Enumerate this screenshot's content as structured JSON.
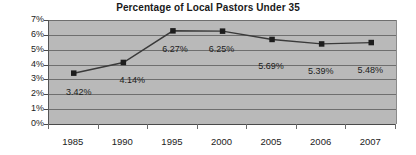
{
  "chart_data": {
    "type": "line",
    "title": "Percentage of Local Pastors Under 35",
    "xlabel": "",
    "ylabel": "",
    "categories": [
      "1985",
      "1990",
      "1995",
      "2000",
      "2005",
      "2006",
      "2007"
    ],
    "values": [
      3.42,
      4.14,
      6.27,
      6.25,
      5.69,
      5.39,
      5.48
    ],
    "point_labels": [
      "3.42%",
      "4.14%",
      "6.27%",
      "6.25%",
      "5.69%",
      "5.39%",
      "5.48%"
    ],
    "ylim": [
      0,
      7
    ],
    "ytick_values": [
      7,
      6,
      5,
      4,
      3,
      2,
      1,
      0
    ],
    "ytick_labels": [
      "7%",
      "6%",
      "5%",
      "4%",
      "3%",
      "2%",
      "1%",
      "0%"
    ],
    "grid": true,
    "legend": false,
    "series": [
      {
        "name": "Percentage of Local Pastors Under 35",
        "values": [
          3.42,
          4.14,
          6.27,
          6.25,
          5.69,
          5.39,
          5.48
        ],
        "marker": "square",
        "marker_color": "#1d1d1d",
        "line_color": "#3a3a3a"
      }
    ],
    "colors": {
      "plot_background": "#b9b9b9",
      "figure_background": "#ffffff",
      "gridline": "#6e6e6e",
      "axis": "#4a4a4a",
      "text": "#1c1c1c",
      "line": "#3a3a3a",
      "marker": "#1d1d1d"
    }
  }
}
